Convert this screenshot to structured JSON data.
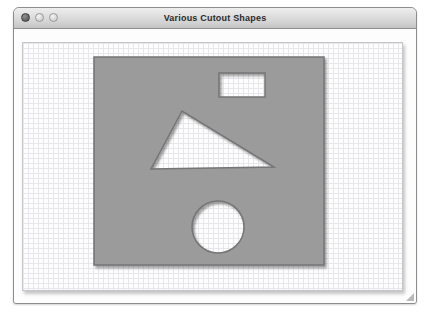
{
  "window": {
    "title": "Various Cutout Shapes",
    "controls": [
      "close",
      "minimize",
      "zoom"
    ]
  },
  "colors": {
    "square_fill": "#9b9b9b",
    "square_stroke": "#757575",
    "titlebar_text": "#2a2a2a",
    "grid_line": "#e6e6eb",
    "panel_background": "#fdfdfe"
  },
  "canvas": {
    "grid_spacing": 5,
    "width": 379,
    "height": 247,
    "square": {
      "x": 71,
      "y": 14,
      "width": 230,
      "height": 208
    },
    "cutouts": {
      "rectangle": {
        "x": 196,
        "y": 30,
        "width": 46,
        "height": 24
      },
      "triangle": {
        "points": [
          [
            159,
            68
          ],
          [
            128,
            126
          ],
          [
            251,
            124
          ]
        ]
      },
      "circle": {
        "cx": 195,
        "cy": 184,
        "r": 26
      }
    }
  }
}
